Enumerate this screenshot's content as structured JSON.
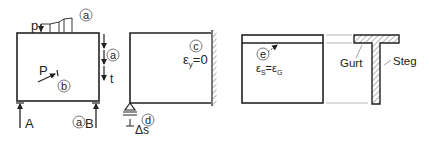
{
  "panel_1": {
    "load_label": "p",
    "load_marker": "a",
    "point_load_label": "P",
    "point_load_marker": "b",
    "edge_marker": "a",
    "edge_load_label": "t",
    "support_left_label": "A",
    "support_right_marker": "a",
    "support_right_label": "B"
  },
  "panel_2": {
    "marker_c": "c",
    "strain_symbol": "ε",
    "strain_subscript": "y",
    "strain_value": "=0",
    "marker_d": "d",
    "settlement_label": "Δs"
  },
  "panel_3": {
    "marker_e": "e",
    "strain_s_symbol": "ε",
    "strain_s_sub": "S",
    "equals": "=",
    "strain_g_symbol": "ε",
    "strain_g_sub": "G"
  },
  "panel_4": {
    "flange_label": "Gurt",
    "web_label": "Steg"
  },
  "colors": {
    "line": "#222222",
    "thin_line": "#888888",
    "background": "#ffffff"
  }
}
